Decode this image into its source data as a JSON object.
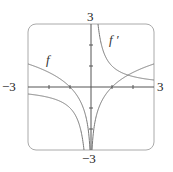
{
  "chart_data": {
    "type": "line",
    "title": "",
    "xlabel": "",
    "ylabel": "",
    "xlim": [
      -3,
      3
    ],
    "ylim": [
      -3,
      3
    ],
    "grid": false,
    "tick_labels": {
      "x_left": "−3",
      "x_right": "3",
      "y_top": "3",
      "y_bottom": "−3"
    },
    "ticks": {
      "x": [
        -2,
        -1,
        1,
        2
      ],
      "y": [
        -2,
        -1,
        1,
        2
      ]
    },
    "series": [
      {
        "name": "f",
        "label": "f",
        "formula": "ln|x|",
        "color": "#777777"
      },
      {
        "name": "f'",
        "label": "f ′",
        "formula": "1/x",
        "color": "#777777"
      }
    ],
    "annotations": [
      {
        "text": "f",
        "x": -2.0,
        "y": 1.2
      },
      {
        "text": "f ′",
        "x": 1.0,
        "y": 2.1
      }
    ]
  },
  "colors": {
    "frame": "#aaaaaa",
    "axis": "#555555",
    "curve": "#777777"
  }
}
